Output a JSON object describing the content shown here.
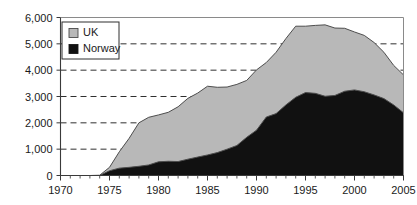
{
  "chart_data": {
    "type": "area",
    "stacked": true,
    "title": "",
    "subtitle": "",
    "xlabel": "",
    "ylabel": "",
    "xlim": [
      1970,
      2005
    ],
    "ylim": [
      0,
      6000
    ],
    "grid": true,
    "grid_style": "dashed-horizontal",
    "legend_position": "top-left-inside",
    "x_tick_labels": [
      "1970",
      "1975",
      "1980",
      "1985",
      "1990",
      "1995",
      "2000",
      "2005"
    ],
    "x_tick_values": [
      1970,
      1975,
      1980,
      1985,
      1990,
      1995,
      2000,
      2005
    ],
    "x_minor_tick_interval": 1,
    "y_tick_labels": [
      "0",
      "1,000",
      "2,000",
      "3,000",
      "4,000",
      "5,000",
      "6,000"
    ],
    "y_tick_values": [
      0,
      1000,
      2000,
      3000,
      4000,
      5000,
      6000
    ],
    "x": [
      1970,
      1971,
      1972,
      1973,
      1974,
      1975,
      1976,
      1977,
      1978,
      1979,
      1980,
      1981,
      1982,
      1983,
      1984,
      1985,
      1986,
      1987,
      1988,
      1989,
      1990,
      1991,
      1992,
      1993,
      1994,
      1995,
      1996,
      1997,
      1998,
      1999,
      2000,
      2001,
      2002,
      2003,
      2004,
      2005
    ],
    "series": [
      {
        "name": "Norway",
        "color": "#111111",
        "values": [
          0,
          0,
          0,
          0,
          0,
          180,
          280,
          310,
          350,
          400,
          520,
          540,
          530,
          620,
          700,
          780,
          870,
          1000,
          1140,
          1450,
          1720,
          2220,
          2350,
          2680,
          2970,
          3150,
          3120,
          3010,
          3040,
          3200,
          3250,
          3180,
          3060,
          2920,
          2680,
          2380
        ]
      },
      {
        "name": "UK",
        "color": "#b8b8b8",
        "values": [
          0,
          0,
          0,
          0,
          10,
          130,
          620,
          1100,
          1650,
          1810,
          1780,
          1860,
          2080,
          2310,
          2430,
          2610,
          2480,
          2360,
          2320,
          2160,
          2290,
          2070,
          2330,
          2520,
          2700,
          2520,
          2580,
          2710,
          2560,
          2390,
          2200,
          2140,
          1990,
          1760,
          1500,
          1440
        ]
      }
    ],
    "totals": [
      0,
      0,
      0,
      0,
      10,
      310,
      900,
      1410,
      2000,
      2210,
      2300,
      2400,
      2610,
      2930,
      3130,
      3390,
      3350,
      3360,
      3460,
      3610,
      4010,
      4290,
      4680,
      5200,
      5670,
      5670,
      5700,
      5720,
      5600,
      5590,
      5450,
      5320,
      5050,
      4680,
      4180,
      3820
    ]
  },
  "legend": {
    "items": [
      {
        "label": "UK",
        "color": "#b8b8b8"
      },
      {
        "label": "Norway",
        "color": "#111111"
      }
    ]
  }
}
